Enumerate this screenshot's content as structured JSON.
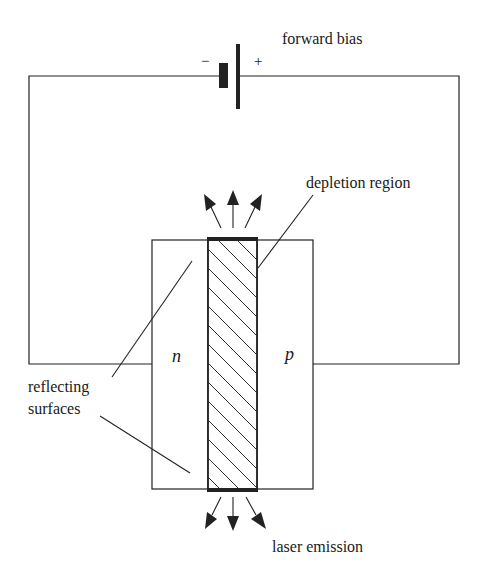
{
  "diagram": {
    "labels": {
      "forward_bias": "forward bias",
      "minus": "−",
      "plus": "+",
      "depletion_region": "depletion region",
      "n_region": "n",
      "p_region": "p",
      "reflecting_line1": "reflecting",
      "reflecting_line2": "surfaces",
      "laser_emission": "laser emission"
    },
    "components": [
      {
        "id": "battery",
        "type": "dc-source",
        "label": "forward bias"
      },
      {
        "id": "n-block",
        "type": "semiconductor",
        "label": "n"
      },
      {
        "id": "depletion",
        "type": "junction",
        "label": "depletion region",
        "fill": "hatched"
      },
      {
        "id": "p-block",
        "type": "semiconductor",
        "label": "p"
      },
      {
        "id": "mirror-top",
        "type": "reflecting-surface"
      },
      {
        "id": "mirror-bottom",
        "type": "reflecting-surface"
      }
    ],
    "arrows": {
      "top_emission_count": 3,
      "bottom_emission_count": 3
    },
    "colors": {
      "line": "#222222",
      "background": "#ffffff"
    }
  }
}
